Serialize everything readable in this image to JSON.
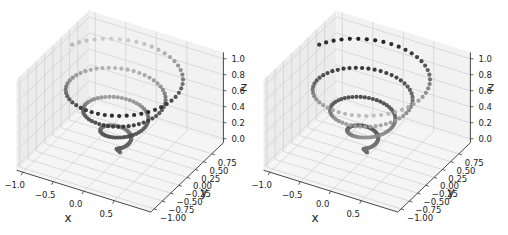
{
  "chart_data": [
    {
      "type": "scatter",
      "subtype": "3d-helix",
      "title": "",
      "xlabel": "x",
      "ylabel": "y",
      "zlabel": "z",
      "x_ticks": [
        "−1.0",
        "−0.5",
        "0.0",
        "0.5"
      ],
      "y_ticks": [
        "−1.00",
        "−0.75",
        "−0.50",
        "−0.25",
        "0.00",
        "0.25",
        "0.50",
        "0.75"
      ],
      "z_ticks": [
        "0.0",
        "0.2",
        "0.4",
        "0.6",
        "0.8",
        "1.0"
      ],
      "xlim": [
        -1,
        1
      ],
      "ylim": [
        -1,
        1
      ],
      "zlim": [
        0,
        1
      ],
      "series": [
        {
          "name": "helix",
          "equation": "x = z·cos(t), y = z·sin(t)",
          "z_range": [
            0,
            1
          ],
          "turns": 4,
          "points": 200
        }
      ],
      "color": "grayscale",
      "shade_mode": "front-dark",
      "grid": true,
      "legend": false
    },
    {
      "type": "scatter",
      "subtype": "3d-helix",
      "title": "",
      "xlabel": "x",
      "ylabel": "y",
      "zlabel": "z",
      "x_ticks": [
        "−1.0",
        "−0.5",
        "0.0",
        "0.5"
      ],
      "y_ticks": [
        "−1.00",
        "−0.75",
        "−0.50",
        "−0.25",
        "0.00",
        "0.25",
        "0.50",
        "0.75"
      ],
      "z_ticks": [
        "0.0",
        "0.2",
        "0.4",
        "0.6",
        "0.8",
        "1.0"
      ],
      "xlim": [
        -1,
        1
      ],
      "ylim": [
        -1,
        1
      ],
      "zlim": [
        0,
        1
      ],
      "series": [
        {
          "name": "helix",
          "equation": "x = z·cos(t), y = z·sin(t)",
          "z_range": [
            0,
            1
          ],
          "turns": 4,
          "points": 200
        }
      ],
      "color": "grayscale",
      "shade_mode": "back-dark",
      "grid": true,
      "legend": false
    }
  ],
  "panels": [
    {
      "offset_x": 0,
      "x_label": "x",
      "y_label": "y",
      "z_label": "z"
    },
    {
      "offset_x": 247,
      "x_label": "x",
      "y_label": "y",
      "z_label": "z"
    }
  ]
}
